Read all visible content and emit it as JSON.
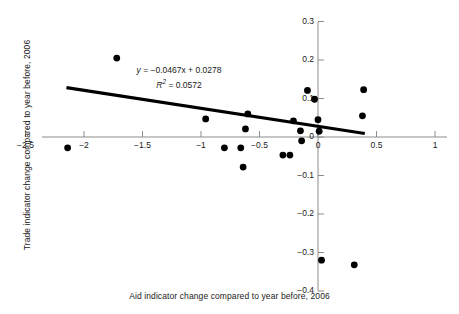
{
  "chart_data": {
    "type": "scatter",
    "title": "",
    "xlabel": "Aid indicator change compared to year before, 2006",
    "ylabel": "Trade indicator change compared to year before, 2006",
    "xlim": [
      -2.6,
      1.05
    ],
    "ylim": [
      -0.4,
      0.3
    ],
    "grid": false,
    "legend": null,
    "x_ticks": [
      -2.5,
      -2,
      -1.5,
      -1,
      -0.5,
      0,
      0.5,
      1
    ],
    "x_tick_labels": [
      "−2.5",
      "−2",
      "−1.5",
      "−1",
      "−0.5",
      "0",
      "0.5",
      "1"
    ],
    "y_ticks": [
      0.3,
      0.2,
      0.1,
      0,
      -0.1,
      -0.2,
      -0.3,
      -0.4
    ],
    "y_tick_labels": [
      "0.3",
      "0.2",
      "0.1",
      "0",
      "−0.1",
      "−0.2",
      "−0.3",
      "−0.4"
    ],
    "marker": {
      "shape": "circle",
      "color": "#000000",
      "size": 3.4
    },
    "points": [
      {
        "x": -2.14,
        "y": -0.028
      },
      {
        "x": -1.72,
        "y": 0.205
      },
      {
        "x": -0.96,
        "y": 0.047
      },
      {
        "x": -0.8,
        "y": -0.028
      },
      {
        "x": -0.66,
        "y": -0.028
      },
      {
        "x": -0.62,
        "y": 0.021
      },
      {
        "x": -0.6,
        "y": 0.06
      },
      {
        "x": -0.64,
        "y": -0.078
      },
      {
        "x": -0.3,
        "y": -0.047
      },
      {
        "x": -0.24,
        "y": -0.047
      },
      {
        "x": -0.21,
        "y": 0.042
      },
      {
        "x": -0.15,
        "y": 0.016
      },
      {
        "x": -0.14,
        "y": -0.01
      },
      {
        "x": -0.09,
        "y": 0.121
      },
      {
        "x": -0.03,
        "y": 0.098
      },
      {
        "x": 0.0,
        "y": 0.045
      },
      {
        "x": 0.01,
        "y": 0.015
      },
      {
        "x": 0.39,
        "y": 0.123
      },
      {
        "x": 0.38,
        "y": 0.055
      },
      {
        "x": 0.03,
        "y": -0.32
      },
      {
        "x": 0.31,
        "y": -0.332
      }
    ],
    "trendline": {
      "slope": -0.0467,
      "intercept": 0.0278,
      "x_start": -2.15,
      "x_end": 0.4,
      "color": "#000000",
      "width": 3.2
    },
    "annotations": {
      "equation": "y = −0.0467x + 0.0278",
      "equation_prefix_italic": "y",
      "r_squared_label": "R",
      "r_squared_exponent": "2",
      "r_squared_value": " = 0.0572",
      "r_squared_full": "R² = 0.0572"
    }
  },
  "axis_titles": {
    "x": "Aid indicator change compared to year before, 2006",
    "y": "Trade indicator change compared to year before, 2006"
  }
}
